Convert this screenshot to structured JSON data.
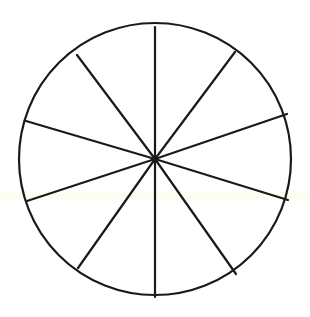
{
  "diagram": {
    "shape": "circle",
    "sectors": 10,
    "center": [
      155,
      159
    ],
    "radius": 136,
    "stroke_color": "#1a1a1a",
    "background": "#ffffff",
    "spokes": [
      {
        "from": [
          155,
          159
        ],
        "to": [
          155,
          27
        ]
      },
      {
        "from": [
          155,
          159
        ],
        "to": [
          235,
          52
        ]
      },
      {
        "from": [
          155,
          159
        ],
        "to": [
          287,
          114
        ]
      },
      {
        "from": [
          155,
          159
        ],
        "to": [
          288,
          200
        ]
      },
      {
        "from": [
          155,
          159
        ],
        "to": [
          236,
          274
        ]
      },
      {
        "from": [
          155,
          159
        ],
        "to": [
          155,
          297
        ]
      },
      {
        "from": [
          155,
          159
        ],
        "to": [
          78,
          268
        ]
      },
      {
        "from": [
          155,
          159
        ],
        "to": [
          27,
          201
        ]
      },
      {
        "from": [
          155,
          159
        ],
        "to": [
          26,
          121
        ]
      },
      {
        "from": [
          155,
          159
        ],
        "to": [
          77,
          55
        ]
      }
    ]
  }
}
